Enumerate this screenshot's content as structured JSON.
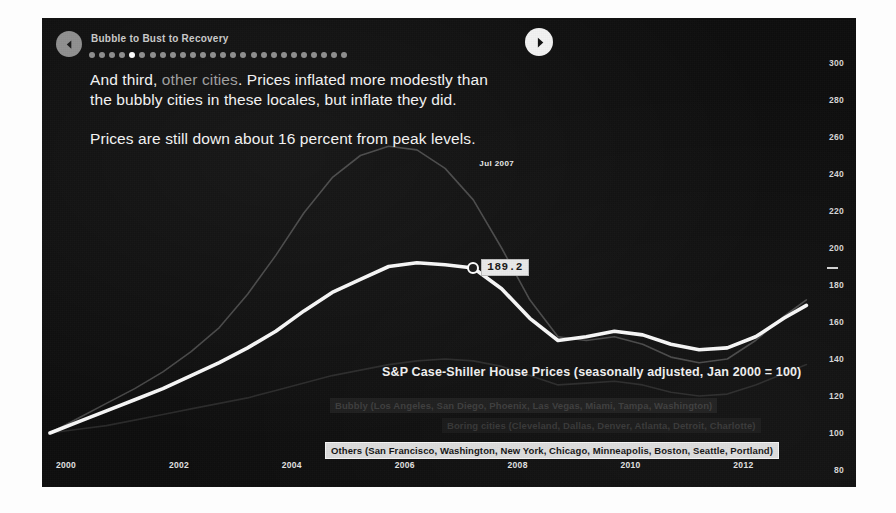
{
  "header": {
    "deck_title": "Bubble to Bust to Recovery",
    "back_icon": "chevron-left-icon",
    "forward_icon": "chevron-right-icon",
    "dots_total": 26,
    "dots_active_index": 4
  },
  "narrative": {
    "para1_lead": "And third, ",
    "para1_highlight": "other cities",
    "para1_rest": ". Prices inflated more modestly than the bubbly cities in these locales, but inflate they did.",
    "para2": "Prices are still down about 16 percent from peak levels."
  },
  "chart_title": "S&P Case-Shiller House Prices (seasonally adjusted, Jan 2000 = 100)",
  "annotations": {
    "peak_date_label": "Jul 2007",
    "value_chip": "189.2"
  },
  "legend": {
    "bubbly": "Bubbly (Los Angeles, San Diego, Phoenix, Las Vegas, Miami, Tampa, Washington)",
    "boring": "Boring cities (Cleveland, Dallas, Denver, Atlanta, Detroit, Charlotte)",
    "others": "Others (San Francisco, Washington, New York, Chicago, Minneapolis, Boston, Seattle, Portland)"
  },
  "colors": {
    "panel_bg": "#0d0d0d",
    "active_series": "#ffffff",
    "muted_series": "#6a6a6a",
    "faint_series": "#4a4a4a",
    "axis_text": "#d7d7d7"
  },
  "chart_data": {
    "type": "line",
    "title": "S&P Case-Shiller House Prices (seasonally adjusted, Jan 2000 = 100)",
    "xlabel": "",
    "ylabel": "Index (Jan 2000 = 100)",
    "xlim": [
      2000,
      2013.5
    ],
    "ylim": [
      80,
      300
    ],
    "yticks": [
      80,
      100,
      120,
      140,
      160,
      180,
      200,
      220,
      240,
      260,
      280,
      300
    ],
    "xticks": [
      2000,
      2002,
      2004,
      2006,
      2008,
      2010,
      2012
    ],
    "grid": false,
    "legend_position": "bottom-center",
    "highlight_series": "Others",
    "annotation_point": {
      "x": 2007.5,
      "y": 189.2,
      "date_label": "Jul 2007",
      "value_label": "189.2"
    },
    "x": [
      2000.0,
      2000.5,
      2001.0,
      2001.5,
      2002.0,
      2002.5,
      2003.0,
      2003.5,
      2004.0,
      2004.5,
      2005.0,
      2005.5,
      2006.0,
      2006.5,
      2007.0,
      2007.5,
      2008.0,
      2008.5,
      2009.0,
      2009.5,
      2010.0,
      2010.5,
      2011.0,
      2011.5,
      2012.0,
      2012.5,
      2013.0,
      2013.4
    ],
    "series": [
      {
        "name": "Others",
        "color": "#ffffff",
        "highlighted": true,
        "values": [
          100,
          106,
          112,
          118,
          124,
          131,
          138,
          146,
          155,
          166,
          176,
          183,
          190,
          192,
          191,
          189.2,
          178,
          162,
          150,
          152,
          155,
          153,
          148,
          145,
          146,
          152,
          162,
          169
        ]
      },
      {
        "name": "Bubbly",
        "color": "#6a6a6a",
        "highlighted": false,
        "values": [
          100,
          108,
          116,
          124,
          133,
          144,
          157,
          175,
          196,
          219,
          238,
          250,
          255,
          253,
          243,
          226,
          200,
          172,
          152,
          150,
          152,
          148,
          141,
          138,
          140,
          150,
          163,
          172
        ]
      },
      {
        "name": "Boring cities",
        "color": "#4a4a4a",
        "highlighted": false,
        "values": [
          100,
          102,
          104,
          107,
          110,
          113,
          116,
          119,
          123,
          127,
          131,
          134,
          137,
          139,
          140,
          139,
          136,
          131,
          126,
          127,
          128,
          126,
          122,
          120,
          121,
          126,
          132,
          137
        ]
      }
    ]
  }
}
